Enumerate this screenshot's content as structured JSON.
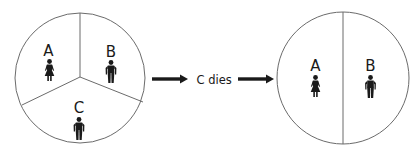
{
  "diagram": {
    "before": {
      "shape": "circle",
      "sections": [
        {
          "label": "A",
          "icon": "female-person-icon"
        },
        {
          "label": "B",
          "icon": "male-person-icon"
        },
        {
          "label": "C",
          "icon": "male-person-icon"
        }
      ]
    },
    "transition": {
      "label": "C dies",
      "arrows": 2
    },
    "after": {
      "shape": "circle",
      "sections": [
        {
          "label": "A",
          "icon": "female-person-icon"
        },
        {
          "label": "B",
          "icon": "male-person-icon"
        }
      ]
    },
    "colors": {
      "outline": "#6b6b6b",
      "figure": "#1a1a1a",
      "arrow": "#1a1a1a"
    }
  }
}
